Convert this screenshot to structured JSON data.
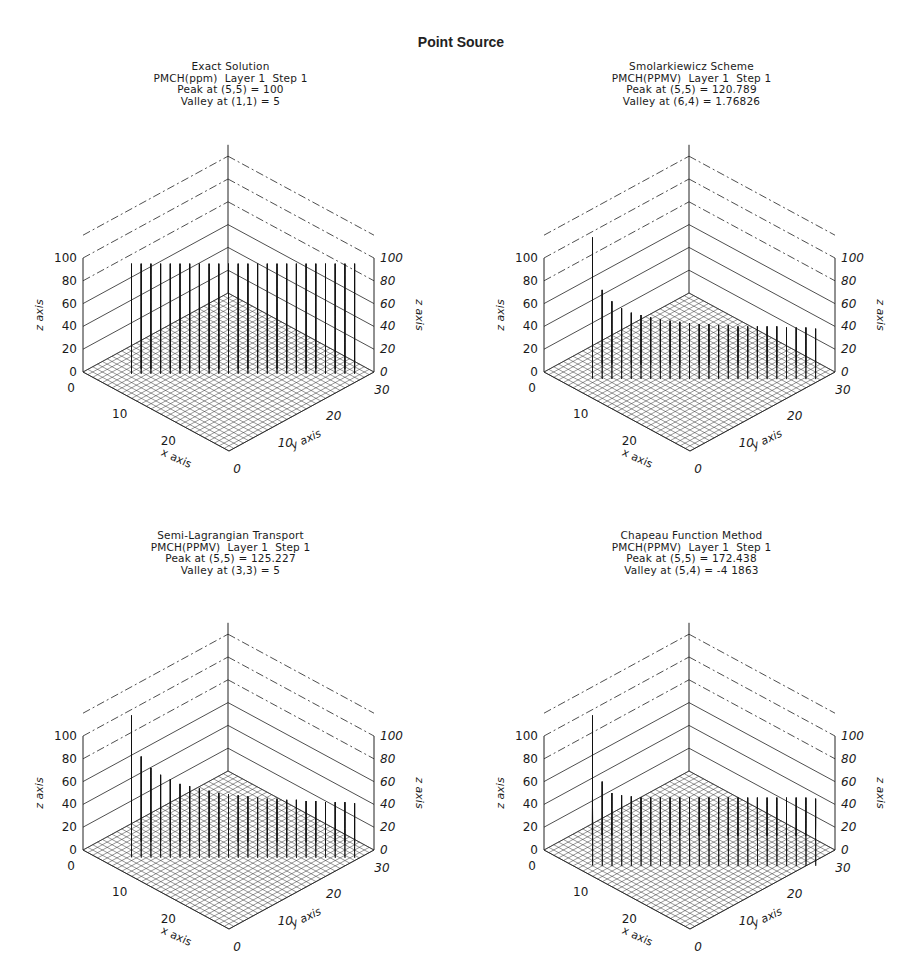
{
  "title": "Point Source",
  "chart_data": [
    {
      "type": "surface3d",
      "title": "Exact Solution",
      "subtitle": "PMCH(ppm)  Layer 1  Step 1",
      "peak_label": "Peak at (5,5) = 100",
      "valley_label": "Valley at (1,1) = 5",
      "peak": {
        "x": 5,
        "y": 5,
        "value": 100
      },
      "valley": {
        "x": 1,
        "y": 1,
        "value": 5
      },
      "xlabel": "x axis",
      "ylabel": "y axis",
      "zlabel": "z axis",
      "xlim": [
        0,
        30
      ],
      "ylim": [
        0,
        30
      ],
      "zlim": [
        0,
        100
      ],
      "x_ticks": [
        "0",
        "10",
        "20"
      ],
      "y_ticks": [
        "0",
        "10",
        "20",
        "30"
      ],
      "z_ticks": [
        "0",
        "20",
        "40",
        "60",
        "80",
        "100"
      ],
      "shape": "spikes",
      "profile": {
        "ridge_heights": [
          95,
          95,
          95,
          95,
          95,
          95,
          95,
          95,
          95,
          95,
          95,
          95,
          95,
          95,
          95,
          95,
          95,
          95,
          95,
          95,
          95,
          95,
          95,
          95
        ],
        "spike_width": 0.35
      }
    },
    {
      "type": "surface3d",
      "title": "Smolarkiewicz Scheme",
      "subtitle": "PMCH(PPMV)  Layer 1  Step 1",
      "peak_label": "Peak at (5,5) = 120.789",
      "valley_label": "Valley at (6,4) = 1.76826",
      "peak": {
        "x": 5,
        "y": 5,
        "value": 120.789
      },
      "valley": {
        "x": 6,
        "y": 4,
        "value": 1.76826
      },
      "xlabel": "x axis",
      "ylabel": "y axis",
      "zlabel": "z axis",
      "xlim": [
        0,
        30
      ],
      "ylim": [
        0,
        30
      ],
      "zlim": [
        0,
        100
      ],
      "x_ticks": [
        "0",
        "10",
        "20"
      ],
      "y_ticks": [
        "0",
        "10",
        "20",
        "30"
      ],
      "z_ticks": [
        "0",
        "20",
        "40",
        "60",
        "80",
        "100"
      ],
      "shape": "decaying-ridge",
      "profile": {
        "ridge_heights": [
          120,
          72,
          62,
          56,
          52,
          50,
          48,
          46,
          45,
          44,
          43,
          42,
          42,
          41,
          41,
          40,
          40,
          40,
          40,
          40,
          39,
          39,
          39,
          38
        ],
        "spike_width": 1.1
      }
    },
    {
      "type": "surface3d",
      "title": "Semi-Lagrangian Transport",
      "subtitle": "PMCH(PPMV)  Layer 1  Step 1",
      "peak_label": "Peak at (5,5) = 125.227",
      "valley_label": "Valley at (3,3) = 5",
      "peak": {
        "x": 5,
        "y": 5,
        "value": 125.227
      },
      "valley": {
        "x": 3,
        "y": 3,
        "value": 5
      },
      "xlabel": "x axis",
      "ylabel": "y axis",
      "zlabel": "z axis",
      "xlim": [
        0,
        30
      ],
      "ylim": [
        0,
        30
      ],
      "zlim": [
        0,
        100
      ],
      "x_ticks": [
        "0",
        "10",
        "20"
      ],
      "y_ticks": [
        "0",
        "10",
        "20",
        "30"
      ],
      "z_ticks": [
        "0",
        "20",
        "40",
        "60",
        "80",
        "100"
      ],
      "shape": "decaying-ridge",
      "profile": {
        "ridge_heights": [
          125,
          82,
          72,
          66,
          62,
          58,
          56,
          54,
          52,
          50,
          49,
          48,
          47,
          46,
          45,
          45,
          44,
          44,
          43,
          43,
          42,
          42,
          42,
          41
        ],
        "spike_width": 1.2
      }
    },
    {
      "type": "surface3d",
      "title": "Chapeau Function Method",
      "subtitle": "PMCH(PPMV)  Layer 1  Step 1",
      "peak_label": "Peak at (5,5) = 172.438",
      "valley_label": "Valley at (5,4) = -4 1863",
      "peak": {
        "x": 5,
        "y": 5,
        "value": 172.438
      },
      "valley": {
        "x": 5,
        "y": 4,
        "value": -4.1863
      },
      "xlabel": "x axis",
      "ylabel": "y axis",
      "zlabel": "z axis",
      "xlim": [
        0,
        30
      ],
      "ylim": [
        0,
        30
      ],
      "zlim": [
        0,
        100
      ],
      "x_ticks": [
        "0",
        "10",
        "20"
      ],
      "y_ticks": [
        "0",
        "10",
        "20",
        "30"
      ],
      "z_ticks": [
        "0",
        "20",
        "40",
        "60",
        "80",
        "100"
      ],
      "shape": "smooth-plateau",
      "profile": {
        "ridge_heights": [
          172,
          60,
          50,
          48,
          47,
          46,
          46,
          46,
          46,
          46,
          46,
          46,
          46,
          46,
          46,
          46,
          46,
          46,
          46,
          46,
          46,
          46,
          46,
          45
        ],
        "spike_width": 2.4
      }
    }
  ]
}
